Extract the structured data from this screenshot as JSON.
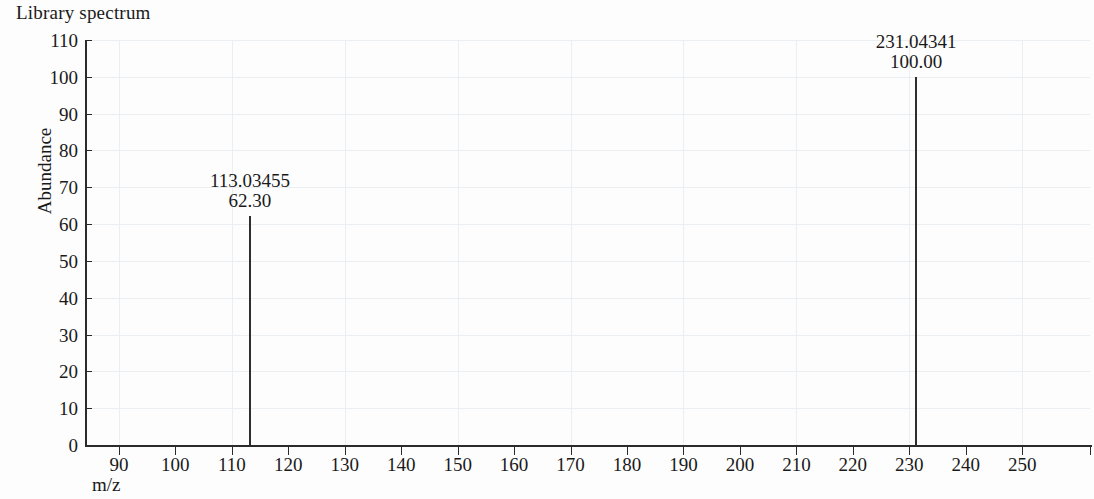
{
  "title": "Library spectrum",
  "axis_label_y": "Abundance",
  "axis_label_x": "m/z",
  "colors": {
    "peak": "#2e2e2e",
    "axis": "#2b2b2b",
    "grid": "#eceff1",
    "background": "#fdfdfd"
  },
  "chart_data": {
    "type": "bar",
    "title": "Library spectrum",
    "xlabel": "m/z",
    "ylabel": "Abundance",
    "xlim": [
      84,
      262
    ],
    "ylim": [
      0,
      110
    ],
    "grid": true,
    "legend": null,
    "x_ticks": [
      90,
      100,
      110,
      120,
      130,
      140,
      150,
      160,
      170,
      180,
      190,
      200,
      210,
      220,
      230,
      240,
      250
    ],
    "y_ticks": [
      0,
      10,
      20,
      30,
      40,
      50,
      60,
      70,
      80,
      90,
      100,
      110
    ],
    "peaks": [
      {
        "mz": 113.03455,
        "intensity": 62.3,
        "mz_label": "113.03455",
        "intensity_label": "62.30"
      },
      {
        "mz": 231.04341,
        "intensity": 100.0,
        "mz_label": "231.04341",
        "intensity_label": "100.00"
      }
    ]
  }
}
